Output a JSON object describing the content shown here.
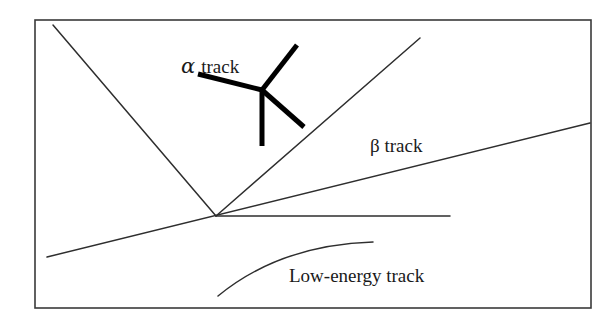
{
  "diagram": {
    "labels": {
      "alpha_symbol": "α",
      "alpha_text": "track",
      "beta_label": "β track",
      "low_energy_label": "Low-energy track"
    },
    "elements": [
      {
        "id": "frame",
        "type": "rectangle"
      },
      {
        "id": "vertex",
        "type": "point",
        "description": "common origin of thin tracks"
      },
      {
        "id": "left-diagonal-track",
        "type": "line"
      },
      {
        "id": "right-diagonal-track",
        "type": "line"
      },
      {
        "id": "beta-track",
        "type": "line",
        "label": "β track"
      },
      {
        "id": "horizontal-track",
        "type": "line"
      },
      {
        "id": "alpha-track",
        "type": "star",
        "arms": 4,
        "label": "α track"
      },
      {
        "id": "low-energy-track",
        "type": "curve",
        "label": "Low-energy track"
      }
    ],
    "colors": {
      "background": "#ffffff",
      "lines": "#2e2e2e",
      "alpha_track": "#000000"
    }
  }
}
